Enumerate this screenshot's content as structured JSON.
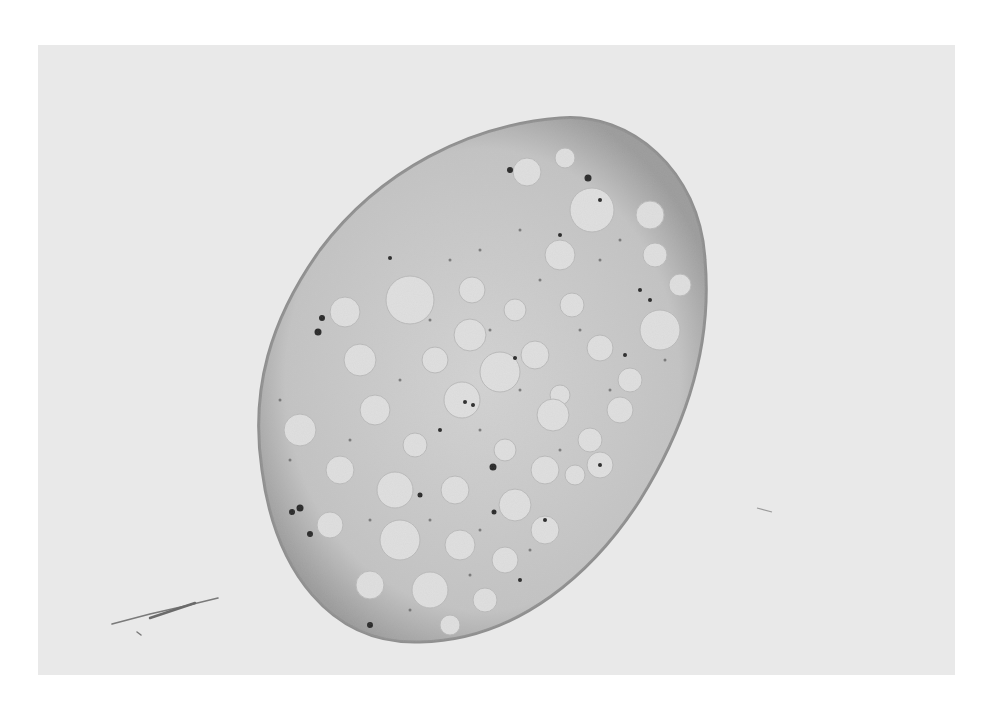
{
  "image": {
    "kind": "grayscale light micrograph",
    "subject": "single oval cell / tissue section with many clear vacuoles and dark granules",
    "background_color": "#e9e9e9",
    "page_color": "#ffffff",
    "specimen": {
      "fill": "#c9c9c9",
      "edge": "#8d8d8d",
      "vacuole_color": "#e2e2e2",
      "granule_color": "#1e1e1e",
      "center": [
        482,
        378
      ],
      "radii": [
        205,
        270
      ],
      "rotation_deg": 30
    },
    "artifacts": [
      "fiber debris lower-left",
      "small streak right"
    ]
  }
}
